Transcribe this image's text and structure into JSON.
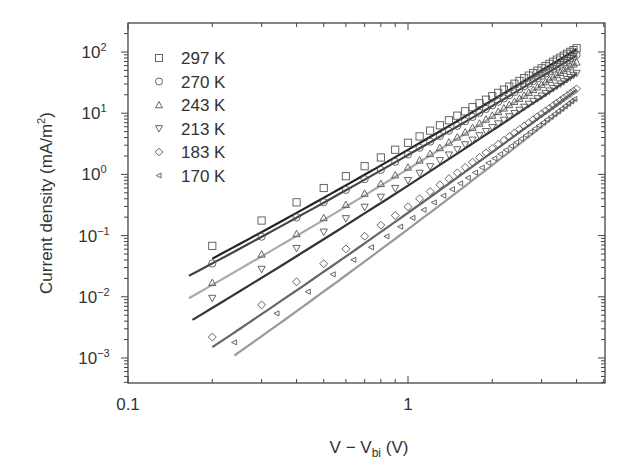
{
  "chart_data": {
    "type": "scatter",
    "title": "",
    "xlabel": "V − V_bi (V)",
    "xlabel_main": "V − V",
    "xlabel_sub": "bi",
    "xlabel_tail": " (V)",
    "ylabel": "Current density (mA/m²)",
    "ylabel_main": "Current density (mA/m",
    "ylabel_sup": "2",
    "ylabel_tail": ")",
    "xscale": "log",
    "yscale": "log",
    "xlim": [
      0.1,
      5.06
    ],
    "ylim": [
      0.0004,
      300
    ],
    "x_ticks": [
      {
        "value": 0.1,
        "label": "0.1"
      },
      {
        "value": 1,
        "label": "1"
      }
    ],
    "y_ticks": [
      {
        "value": 100,
        "base": "10",
        "exp": "2"
      },
      {
        "value": 10,
        "base": "10",
        "exp": "1"
      },
      {
        "value": 1,
        "base": "10",
        "exp": "0"
      },
      {
        "value": 0.1,
        "base": "10",
        "exp": "−1"
      },
      {
        "value": 0.01,
        "base": "10",
        "exp": "−2"
      },
      {
        "value": 0.001,
        "base": "10",
        "exp": "−3"
      }
    ],
    "grid": false,
    "legend_position": "upper left",
    "series": [
      {
        "name": "297 K",
        "marker": "square",
        "line_color": "#222222",
        "x_start": 0.2,
        "x_end": 4.0,
        "y_start": 0.068,
        "y_end": 115,
        "fit_x": [
          0.2,
          4.0
        ],
        "fit_y": [
          0.042,
          112
        ]
      },
      {
        "name": "270 K",
        "marker": "circle",
        "line_color": "#444444",
        "x_start": 0.2,
        "x_end": 4.0,
        "y_start": 0.035,
        "y_end": 90,
        "fit_x": [
          0.165,
          4.0
        ],
        "fit_y": [
          0.022,
          88
        ]
      },
      {
        "name": "243 K",
        "marker": "triangle-up",
        "line_color": "#aaaaaa",
        "x_start": 0.2,
        "x_end": 4.0,
        "y_start": 0.017,
        "y_end": 68,
        "fit_x": [
          0.165,
          4.0
        ],
        "fit_y": [
          0.0095,
          66
        ]
      },
      {
        "name": "213 K",
        "marker": "triangle-down",
        "line_color": "#333333",
        "x_start": 0.2,
        "x_end": 4.0,
        "y_start": 0.0095,
        "y_end": 45,
        "fit_x": [
          0.17,
          4.0
        ],
        "fit_y": [
          0.0042,
          44
        ]
      },
      {
        "name": "183 K",
        "marker": "diamond",
        "line_color": "#666666",
        "x_start": 0.2,
        "x_end": 4.0,
        "y_start": 0.0022,
        "y_end": 25,
        "fit_x": [
          0.2,
          4.0
        ],
        "fit_y": [
          0.0015,
          24
        ]
      },
      {
        "name": "170 K",
        "marker": "triangle-left",
        "line_color": "#999999",
        "x_start": 0.24,
        "x_end": 4.0,
        "y_start": 0.0018,
        "y_end": 18,
        "fit_x": [
          0.24,
          4.0
        ],
        "fit_y": [
          0.0011,
          17
        ]
      }
    ]
  }
}
